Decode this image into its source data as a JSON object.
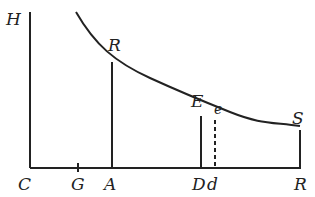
{
  "diagram": {
    "type": "geometric-figure",
    "labels": {
      "H": "H",
      "C": "C",
      "G": "G",
      "A": "A",
      "B": "R",
      "E": "E",
      "e": "e",
      "D": "D",
      "d": "d",
      "S": "S",
      "R": "R"
    },
    "elements": [
      {
        "name": "vertical-axis",
        "from": "C",
        "to": "H"
      },
      {
        "name": "horizontal-axis",
        "from": "C",
        "to": "R"
      },
      {
        "name": "ordinate-AB",
        "from": "A",
        "to": "B",
        "style": "solid"
      },
      {
        "name": "ordinate-DE",
        "from": "D",
        "to": "E",
        "style": "solid"
      },
      {
        "name": "ordinate-de",
        "from": "d",
        "to": "e",
        "style": "dashed"
      },
      {
        "name": "ordinate-RS",
        "from": "R",
        "to": "S",
        "style": "solid"
      },
      {
        "name": "curve",
        "through": [
          "B",
          "E",
          "e",
          "S"
        ]
      },
      {
        "name": "tick-G",
        "on": "horizontal-axis"
      }
    ],
    "colors": {
      "ink": "#222222",
      "background": "#ffffff"
    }
  }
}
